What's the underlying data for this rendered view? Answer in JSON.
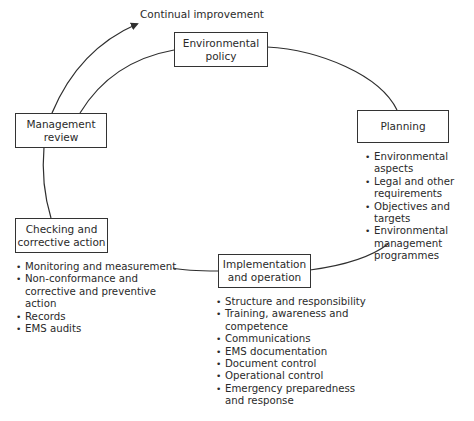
{
  "diagram": {
    "cycle_label": "Continual improvement",
    "stages": [
      {
        "id": "policy",
        "label": "Environmental\npolicy",
        "items": []
      },
      {
        "id": "planning",
        "label": "Planning",
        "items": [
          "Environmental aspects",
          "Legal and other\nrequirements",
          "Objectives and targets",
          "Environmental\nmanagement\nprogrammes"
        ]
      },
      {
        "id": "implementation",
        "label": "Implementation\nand operation",
        "items": [
          "Structure and responsibility",
          "Training, awareness and\ncompetence",
          "Communications",
          "EMS documentation",
          "Document control",
          "Operational control",
          "Emergency preparedness\nand response"
        ]
      },
      {
        "id": "checking",
        "label": "Checking and\ncorrective action",
        "items": [
          "Monitoring and measurement",
          "Non-conformance and\ncorrective and preventive\naction",
          "Records",
          "EMS audits"
        ]
      },
      {
        "id": "review",
        "label": "Management\nreview",
        "items": []
      }
    ],
    "colors": {
      "line": "#2f2f2f",
      "text": "#2a2a2a",
      "background": "#ffffff"
    }
  }
}
